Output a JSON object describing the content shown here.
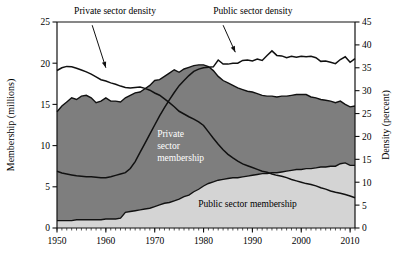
{
  "chart_data": {
    "type": "area",
    "title": "",
    "xlabel": "",
    "ylabel": "Membership (millions)",
    "y2label": "Density (percent)",
    "xlim": [
      1950,
      2011
    ],
    "ylim": [
      0,
      25
    ],
    "y2lim": [
      0,
      45
    ],
    "grid": false,
    "legend_position": "inline-annotations",
    "x_ticks": [
      "1950",
      "1960",
      "1970",
      "1980",
      "1990",
      "2000",
      "2010"
    ],
    "x_tick_values": [
      1950,
      1960,
      1970,
      1980,
      1990,
      2000,
      2010
    ],
    "y_ticks": [
      "0",
      "5",
      "10",
      "15",
      "20",
      "25"
    ],
    "y_tick_values": [
      0,
      5,
      10,
      15,
      20,
      25
    ],
    "y2_ticks": [
      "0",
      "5",
      "10",
      "15",
      "20",
      "25",
      "30",
      "35",
      "40",
      "45"
    ],
    "y2_tick_values": [
      0,
      5,
      10,
      15,
      20,
      25,
      30,
      35,
      40,
      45
    ],
    "x_minor_tick_step": 1,
    "annotations": [
      {
        "name": "private-sector-density-label",
        "text": "Private sector density",
        "x": 1953.5,
        "y_axis": "right",
        "y": 46.8
      },
      {
        "name": "public-sector-density-label",
        "text": "Public sector density",
        "x": 1982.0,
        "y_axis": "right",
        "y": 46.8
      },
      {
        "name": "private-sector-membership-label",
        "line1": "Private",
        "line2": "sector",
        "line3": "membership",
        "x": 1970.5,
        "y_axis": "left",
        "y": 11.0
      },
      {
        "name": "public-sector-membership-label",
        "text": "Public sector membership",
        "x": 1989.0,
        "y_axis": "left",
        "y": 2.6
      }
    ],
    "colors": {
      "private_membership_fill": "#7e7e7e",
      "public_membership_fill": "#d4d4d4",
      "line": "#111111",
      "axis": "#111111",
      "background": "#ffffff"
    },
    "x": [
      1950,
      1951,
      1952,
      1953,
      1954,
      1955,
      1956,
      1957,
      1958,
      1959,
      1960,
      1961,
      1962,
      1963,
      1964,
      1965,
      1966,
      1967,
      1968,
      1969,
      1970,
      1971,
      1972,
      1973,
      1974,
      1975,
      1976,
      1977,
      1978,
      1979,
      1980,
      1981,
      1982,
      1983,
      1984,
      1985,
      1986,
      1987,
      1988,
      1989,
      1990,
      1991,
      1992,
      1993,
      1994,
      1995,
      1996,
      1997,
      1998,
      1999,
      2000,
      2001,
      2002,
      2003,
      2004,
      2005,
      2006,
      2007,
      2008,
      2009,
      2010,
      2011
    ],
    "series": [
      {
        "name": "Public sector membership",
        "units": "millions",
        "axis": "left",
        "stack": "bottom",
        "fill": "#d4d4d4",
        "values": [
          0.9,
          0.9,
          0.9,
          0.9,
          1.0,
          1.0,
          1.0,
          1.0,
          1.0,
          1.0,
          1.1,
          1.1,
          1.1,
          1.2,
          1.9,
          2.0,
          2.1,
          2.2,
          2.3,
          2.4,
          2.6,
          2.8,
          3.0,
          3.1,
          3.3,
          3.5,
          3.8,
          4.0,
          4.4,
          4.7,
          5.1,
          5.4,
          5.6,
          5.8,
          5.9,
          6.0,
          6.1,
          6.1,
          6.2,
          6.3,
          6.4,
          6.5,
          6.6,
          6.6,
          6.7,
          6.7,
          6.8,
          6.9,
          7.0,
          7.1,
          7.1,
          7.2,
          7.2,
          7.3,
          7.4,
          7.4,
          7.5,
          7.5,
          7.8,
          7.9,
          7.6,
          7.6
        ]
      },
      {
        "name": "Private sector membership",
        "units": "millions",
        "axis": "left",
        "stack": "top",
        "fill": "#7e7e7e",
        "values": [
          13.2,
          13.9,
          14.4,
          14.9,
          14.6,
          15.0,
          15.1,
          14.8,
          14.2,
          14.4,
          14.7,
          14.3,
          14.3,
          14.1,
          13.9,
          14.1,
          14.3,
          14.3,
          14.6,
          14.9,
          15.3,
          15.2,
          15.4,
          15.7,
          15.9,
          15.4,
          15.5,
          15.5,
          15.3,
          15.1,
          14.7,
          14.2,
          13.5,
          12.6,
          12.0,
          11.6,
          11.2,
          10.9,
          10.6,
          10.3,
          10.1,
          9.8,
          9.5,
          9.4,
          9.3,
          9.2,
          9.2,
          9.1,
          9.1,
          9.1,
          9.1,
          9.0,
          8.7,
          8.5,
          8.2,
          8.1,
          7.9,
          7.7,
          7.6,
          7.1,
          7.1,
          7.2
        ]
      },
      {
        "name": "Private sector density",
        "units": "percent",
        "axis": "right",
        "type": "line",
        "values": [
          34.4,
          35.0,
          35.3,
          35.2,
          34.9,
          34.5,
          34.1,
          33.6,
          33.0,
          32.4,
          32.1,
          31.7,
          31.4,
          31.0,
          30.7,
          30.6,
          30.7,
          30.8,
          30.5,
          30.1,
          29.5,
          29.0,
          28.2,
          27.4,
          26.5,
          25.5,
          24.9,
          24.3,
          23.8,
          23.2,
          22.4,
          21.0,
          19.6,
          18.3,
          17.1,
          16.1,
          15.3,
          14.6,
          14.0,
          13.6,
          13.2,
          12.8,
          12.4,
          12.2,
          11.8,
          11.5,
          11.3,
          11.0,
          10.6,
          10.3,
          10.0,
          9.7,
          9.5,
          9.2,
          8.8,
          8.5,
          8.1,
          7.8,
          7.6,
          7.3,
          7.0,
          6.6
        ]
      },
      {
        "name": "Public sector density",
        "units": "percent",
        "axis": "right",
        "type": "line",
        "values": [
          12.4,
          12.0,
          11.8,
          11.6,
          11.4,
          11.3,
          11.2,
          11.2,
          11.1,
          11.0,
          11.0,
          11.2,
          11.5,
          11.8,
          12.1,
          13.0,
          14.5,
          16.5,
          18.5,
          20.5,
          22.5,
          24.5,
          26.3,
          28.0,
          29.6,
          31.1,
          32.2,
          33.3,
          34.2,
          34.7,
          35.0,
          35.1,
          35.2,
          36.7,
          35.8,
          35.8,
          36.0,
          36.0,
          36.6,
          36.7,
          36.5,
          36.9,
          36.6,
          37.7,
          38.7,
          37.7,
          37.6,
          37.2,
          37.5,
          37.3,
          37.5,
          37.4,
          37.5,
          37.2,
          36.4,
          36.5,
          36.2,
          35.9,
          36.8,
          37.4,
          36.2,
          37.0
        ]
      }
    ]
  },
  "plot_geometry": {
    "left": 57,
    "right": 355,
    "top": 22,
    "bottom": 228
  }
}
